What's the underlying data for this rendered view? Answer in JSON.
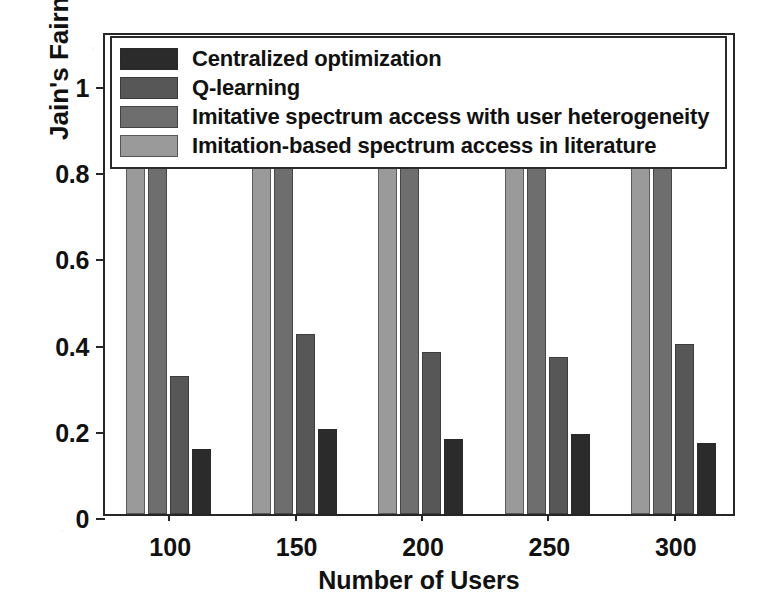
{
  "chart_data": {
    "type": "bar",
    "title": "",
    "xlabel": "Number of Users",
    "ylabel": "Jain's Fairness Index",
    "categories": [
      "100",
      "150",
      "200",
      "250",
      "300"
    ],
    "ylim": [
      0,
      1.12
    ],
    "yticks": [
      "0",
      "0.2",
      "0.4",
      "0.6",
      "0.8",
      "1"
    ],
    "ytick_values": [
      0,
      0.2,
      0.4,
      0.6,
      0.8,
      1
    ],
    "grid": false,
    "legend_position": "top-left-inside",
    "series": [
      {
        "name": "Centralized optimization",
        "color": "#2b2b2b",
        "values": [
          0.15,
          0.197,
          0.175,
          0.185,
          0.165
        ]
      },
      {
        "name": "Q-learning",
        "color": "#575757",
        "values": [
          0.32,
          0.418,
          0.376,
          0.365,
          0.394
        ]
      },
      {
        "name": "Imitative spectrum access with user heterogeneity",
        "color": "#6e6e6e",
        "values": [
          0.971,
          0.957,
          0.946,
          0.955,
          0.937
        ]
      },
      {
        "name": "Imitation-based spectrum access in literature",
        "color": "#9a9a9a",
        "values": [
          0.949,
          0.928,
          0.918,
          0.945,
          0.904
        ]
      }
    ],
    "bar_draw_order": [
      "Imitation-based spectrum access in literature",
      "Imitative spectrum access with user heterogeneity",
      "Q-learning",
      "Centralized optimization"
    ]
  },
  "legend": {
    "items": [
      {
        "label": "Centralized optimization",
        "swatch_class": "s0"
      },
      {
        "label": "Q-learning",
        "swatch_class": "s1"
      },
      {
        "label": "Imitative spectrum access with user heterogeneity",
        "swatch_class": "s2"
      },
      {
        "label": "Imitation-based spectrum access in literature",
        "swatch_class": "s3"
      }
    ]
  },
  "axes": {
    "y_title": "Jain's Fairness Index",
    "x_title": "Number of Users",
    "y_tick_labels": [
      "1",
      "0.8",
      "0.6",
      "0.4",
      "0.2",
      "0"
    ],
    "x_tick_labels": [
      "100",
      "150",
      "200",
      "250",
      "300"
    ]
  },
  "colors": {
    "series_0": "#2b2b2b",
    "series_1": "#575757",
    "series_2": "#6e6e6e",
    "series_3": "#9a9a9a",
    "axis": "#262626",
    "text": "#111111",
    "background": "#ffffff"
  }
}
